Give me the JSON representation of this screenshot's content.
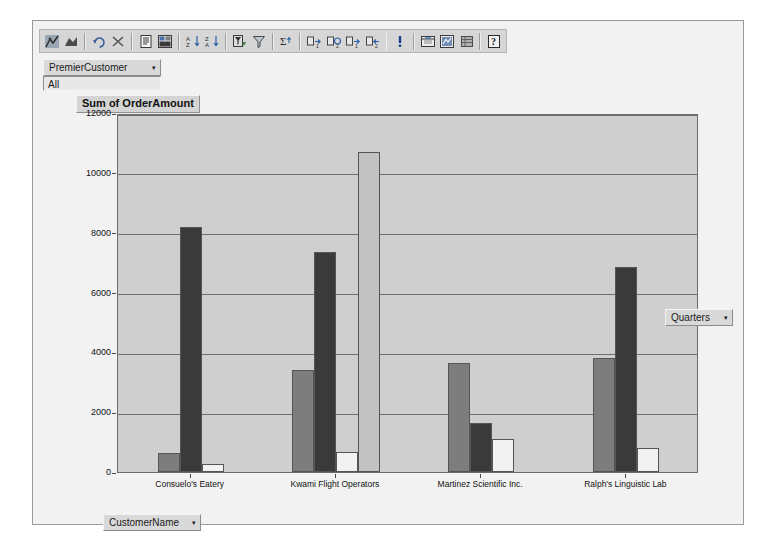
{
  "window": {
    "title": "PivotChart"
  },
  "toolbar": {
    "items": [
      {
        "name": "pivotchart-wizard-icon",
        "glyph": "chart"
      },
      {
        "name": "pivottable-field-icon",
        "glyph": "field"
      },
      {
        "name": "undo-icon",
        "glyph": "undo"
      },
      {
        "name": "delete-icon",
        "glyph": "x"
      },
      {
        "name": "properties-icon",
        "glyph": "list"
      },
      {
        "name": "field-settings-icon",
        "glyph": "settings"
      },
      {
        "name": "sort-ascending-icon",
        "glyph": "az"
      },
      {
        "name": "sort-descending-icon",
        "glyph": "za"
      },
      {
        "name": "autofilter-icon",
        "glyph": "filter-on"
      },
      {
        "name": "filter-icon",
        "glyph": "filter"
      },
      {
        "name": "autocalc-icon",
        "glyph": "sigma"
      },
      {
        "name": "show-details-icon",
        "glyph": "expand"
      },
      {
        "name": "hide-details-icon",
        "glyph": "collapse"
      },
      {
        "name": "refresh-expand-icon",
        "glyph": "expand2"
      },
      {
        "name": "refresh-collapse-icon",
        "glyph": "collapse2"
      },
      {
        "name": "refresh-data-icon",
        "glyph": "exclaim"
      },
      {
        "name": "export-excel-icon",
        "glyph": "export"
      },
      {
        "name": "switch-view-icon",
        "glyph": "view"
      },
      {
        "name": "field-list-icon",
        "glyph": "fieldlist"
      },
      {
        "name": "help-icon",
        "glyph": "help"
      }
    ],
    "separators_after": [
      1,
      3,
      5,
      7,
      9,
      10,
      14,
      15,
      18
    ]
  },
  "page_filter": {
    "field_label": "PremierCustomer",
    "caret": "▾",
    "value": "All"
  },
  "legend_field": {
    "label": "Quarters",
    "caret": "▾"
  },
  "category_field": {
    "label": "CustomerName",
    "caret": "▾"
  },
  "chart_data": {
    "type": "bar",
    "title": "Sum of OrderAmount",
    "xlabel": "CustomerName",
    "ylabel": "",
    "ylim": [
      0,
      12000
    ],
    "ytick_step": 2000,
    "yticks": [
      "0",
      "2000",
      "4000",
      "6000",
      "8000",
      "10000",
      "12000"
    ],
    "grid": true,
    "legend_position": "right",
    "categories": [
      "Consuelo's Eatery",
      "Kwami Flight Operators",
      "Martinez Scientific Inc.",
      "Ralph's Linguistic Lab"
    ],
    "series": [
      {
        "name": "Qtr1",
        "color": "#7d7d7d",
        "values": [
          650,
          3400,
          3650,
          3800
        ]
      },
      {
        "name": "Qtr2",
        "color": "#3a3a3a",
        "values": [
          8200,
          7350,
          1650,
          6850
        ]
      },
      {
        "name": "Qtr3",
        "color": "#f2f2f2",
        "values": [
          280,
          670,
          1100,
          800
        ]
      },
      {
        "name": "Qtr4",
        "color": "#c2c2c2",
        "values": [
          null,
          10700,
          null,
          null
        ]
      }
    ],
    "plot_background": "#cfcfcf",
    "gridline_color": "#6f6f6f"
  }
}
